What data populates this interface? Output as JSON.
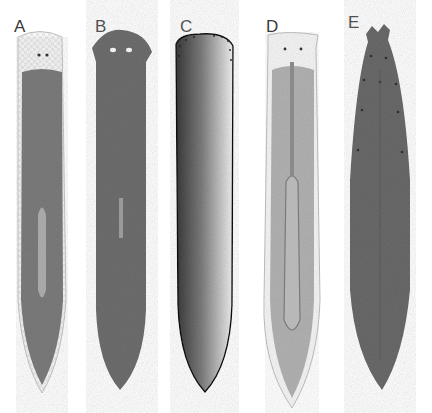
{
  "figure": {
    "panels": [
      {
        "label": "A",
        "style": "light-margin, branched gut, pharynx visible",
        "color": "#7a7a7a"
      },
      {
        "label": "B",
        "style": "dark uniform, two eyes, rounded head",
        "color": "#6e6e6e"
      },
      {
        "label": "C",
        "style": "stippled outline, dark left-side pigmentation",
        "color": "#2a2a2a"
      },
      {
        "label": "D",
        "style": "pale with dendritic gut and elongated pharynx",
        "color": "#9a9a9a"
      },
      {
        "label": "E",
        "style": "dark with auricles and dotted spots",
        "color": "#6a6a6a"
      }
    ]
  }
}
